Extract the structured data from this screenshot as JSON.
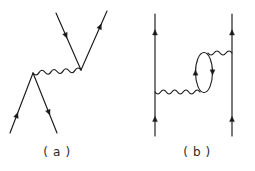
{
  "figure": {
    "kind": "feynman-diagrams",
    "background_color": "#ffffff",
    "line_color": "#1a1a1a",
    "label_color": "#2b2b2b",
    "canvas": {
      "width": 255,
      "height": 171
    },
    "panels": [
      {
        "id": "a",
        "label": "( a )",
        "label_position": {
          "x": 57,
          "y": 156
        },
        "description": "tree-level vertex: two incoming fermion legs meeting at lower vertex, photon exchange to upper vertex with two outgoing fermion legs",
        "photon": {
          "name": "photon-line-a",
          "x1": 33,
          "y1": 73,
          "x2": 81,
          "y2": 70,
          "wavelength": 6.2,
          "amplitude": 3.0
        },
        "fermions": [
          {
            "name": "fermion-upper-left-a",
            "x1": 56,
            "y1": 13,
            "x2": 81,
            "y2": 70,
            "arrow_t": 0.4,
            "arrow_dir": "toward-vertex"
          },
          {
            "name": "fermion-upper-right-a",
            "x1": 81,
            "y1": 70,
            "x2": 107,
            "y2": 11,
            "arrow_t": 0.74,
            "arrow_dir": "toward-vertex"
          },
          {
            "name": "fermion-lower-left-a",
            "x1": 10,
            "y1": 133,
            "x2": 33,
            "y2": 73,
            "arrow_t": 0.3,
            "arrow_dir": "toward-vertex"
          },
          {
            "name": "fermion-lower-right-a",
            "x1": 33,
            "y1": 73,
            "x2": 57,
            "y2": 133,
            "arrow_t": 0.66,
            "arrow_dir": "away-from-vertex"
          }
        ]
      },
      {
        "id": "b",
        "label": "( b )",
        "label_position": {
          "x": 197,
          "y": 156
        },
        "description": "vacuum polarization correction: two vertical fermion lines joined by a photon that contains a closed fermion loop",
        "fermion_rails": [
          {
            "name": "fermion-rail-left-b",
            "x1": 155,
            "y1": 136,
            "x2": 155,
            "y2": 14,
            "arrows": [
              {
                "t": 0.14,
                "dir": "up"
              },
              {
                "t": 0.85,
                "dir": "up"
              }
            ]
          },
          {
            "name": "fermion-rail-right-b",
            "x1": 232,
            "y1": 136,
            "x2": 232,
            "y2": 14,
            "arrows": [
              {
                "t": 0.14,
                "dir": "up"
              },
              {
                "t": 0.85,
                "dir": "up"
              }
            ]
          }
        ],
        "photons": [
          {
            "name": "photon-lower-b",
            "x1": 155,
            "y1": 92,
            "x2": 200,
            "y2": 92,
            "wavelength": 6.0,
            "amplitude": 2.8
          },
          {
            "name": "photon-upper-b",
            "x1": 208,
            "y1": 53,
            "x2": 232,
            "y2": 53,
            "wavelength": 6.0,
            "amplitude": 2.8
          }
        ],
        "loop": {
          "name": "fermion-loop-b",
          "cx": 204,
          "cy": 72.5,
          "rx": 8.5,
          "ry": 20,
          "arrows": [
            {
              "side": "left",
              "dir": "up"
            },
            {
              "side": "right",
              "dir": "down"
            }
          ]
        }
      }
    ]
  }
}
